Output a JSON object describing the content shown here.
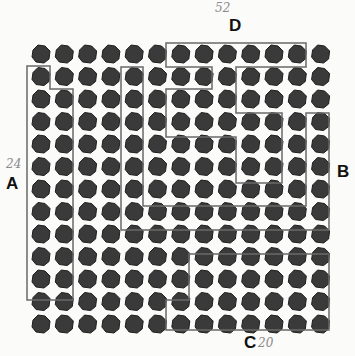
{
  "diagram": {
    "title": "",
    "grid": {
      "rows": 13,
      "cols": 13,
      "x0": 41,
      "y0": 54,
      "dx": 23.3,
      "dy": 22.5
    },
    "colors": {
      "blob": "#3a3a3a",
      "blob_edge": "#1e1e1e",
      "outline": "#6a6a6a",
      "label": "#111111",
      "handwriting": "#8a8a8a"
    },
    "labels": {
      "A": "A",
      "B": "B",
      "C": "C",
      "D": "D"
    },
    "annotations": {
      "A_note": "24",
      "C_note": "20",
      "D_note": "52"
    },
    "regions": [
      {
        "id": "A",
        "points": "27,66 50,66 50,89 73,89 73,300 27,300"
      },
      {
        "id": "outer-band",
        "points": "121,67 143,67 143,206 306,206 306,113 329,113 329,230 121,230"
      },
      {
        "id": "D-inner",
        "points": "166,43 306,43 306,67 236,67 236,113 282,113 282,183 236,183 236,137 166,137 166,89 212,89 212,67 166,67"
      },
      {
        "id": "C",
        "points": "189,254 329,254 329,330 166,330 166,300 189,300"
      }
    ]
  }
}
